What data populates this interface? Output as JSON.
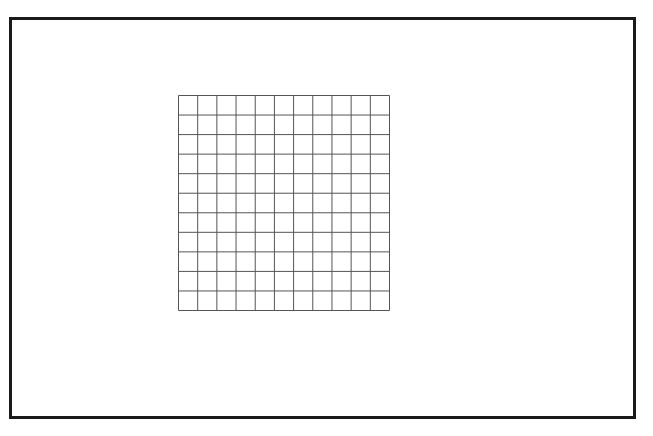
{
  "diagram": {
    "type": "square-grid",
    "rows": 11,
    "columns": 11,
    "cell_size_px": 19.2,
    "line_color": "#555555",
    "frame_color": "#1a1a1a",
    "background_color": "#ffffff"
  }
}
